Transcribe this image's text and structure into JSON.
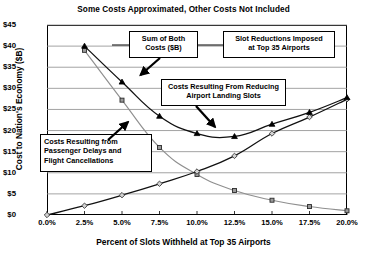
{
  "chart_data": {
    "type": "line",
    "title": "Some Costs Approximated, Other Costs Not Included",
    "xlabel": "Percent of Slots Withheld at Top 35 Airports",
    "ylabel": "Cost to Nation's Economy ($B)",
    "x": [
      0.0,
      2.5,
      5.0,
      7.5,
      10.0,
      12.5,
      15.0,
      17.5,
      20.0
    ],
    "xticklabels": [
      "0.0%",
      "2.5%",
      "5.0%",
      "7.5%",
      "10.0%",
      "12.5%",
      "15.0%",
      "17.5%",
      "20.0%"
    ],
    "yticklabels": [
      "$0",
      "$5",
      "$10",
      "$15",
      "$20",
      "$25",
      "$30",
      "$35",
      "$40",
      "$45"
    ],
    "ytickvalues": [
      0,
      5,
      10,
      15,
      20,
      25,
      30,
      35,
      40,
      45
    ],
    "xlim": [
      0.0,
      20.0
    ],
    "ylim": [
      0,
      45
    ],
    "grid": "horizontal",
    "legend": "none",
    "series": [
      {
        "name": "Costs Resulting from Passenger Delays and Flight Cancellations",
        "marker": "square",
        "color": "#9a9a9a",
        "x": [
          2.5,
          5.0,
          7.5,
          10.0,
          12.5,
          15.0,
          17.5,
          20.0
        ],
        "values": [
          39.0,
          27.2,
          16.0,
          9.6,
          5.8,
          3.5,
          2.0,
          1.0
        ]
      },
      {
        "name": "Costs Resulting From Reducing Airport Landing Slots",
        "marker": "diamond",
        "color": "#6e6e6e",
        "x": [
          0.0,
          2.5,
          5.0,
          7.5,
          10.0,
          12.5,
          15.0,
          17.5,
          20.0
        ],
        "values": [
          0.0,
          2.2,
          4.7,
          7.4,
          10.3,
          14.0,
          19.3,
          23.2,
          27.4
        ]
      },
      {
        "name": "Sum of Both Costs ($B)",
        "marker": "triangle",
        "color": "#000000",
        "x": [
          2.5,
          5.0,
          7.5,
          10.0,
          12.5,
          15.0,
          17.5,
          20.0
        ],
        "values": [
          40.0,
          31.5,
          23.4,
          19.3,
          18.6,
          21.5,
          24.3,
          27.8
        ]
      }
    ],
    "annotations": [
      {
        "id": "sum-of-both",
        "text_line1": "Sum of Both",
        "text_line2": "Costs ($B)"
      },
      {
        "id": "slot-reductions",
        "text_line1": "Slot Reductions Imposed",
        "text_line2": "at Top 35 Airports"
      },
      {
        "id": "reducing-slots",
        "text_line1": "Costs Resulting From Reducing",
        "text_line2": "Airport Landing Slots"
      },
      {
        "id": "passenger-delays",
        "text_line1": "Costs Resulting from",
        "text_line2": "Passenger Delays and",
        "text_line3": "Flight Cancellations"
      }
    ]
  }
}
